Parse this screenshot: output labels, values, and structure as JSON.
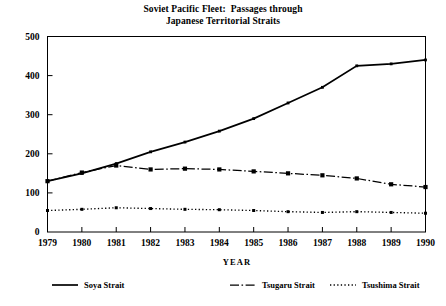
{
  "title": {
    "line1": "Soviet Pacific Fleet:  Passages through",
    "line2": "Japanese Territorial Straits"
  },
  "axes": {
    "xlabel": "YEAR",
    "ylabel": "",
    "ytick_labels": [
      "0",
      "100",
      "200",
      "300",
      "400",
      "500"
    ],
    "xtick_labels": [
      "1979",
      "1980",
      "1981",
      "1982",
      "1983",
      "1984",
      "1985",
      "1986",
      "1987",
      "1988",
      "1989",
      "1990"
    ]
  },
  "legend": {
    "position": "below-axes",
    "entries": [
      {
        "label": "Soya Strait",
        "style": "solid"
      },
      {
        "label": "Tsugaru Strait",
        "style": "dashdot"
      },
      {
        "label": "Tsushima Strait",
        "style": "dotted"
      }
    ]
  },
  "colors": {
    "ink": "#000000",
    "background": "#ffffff"
  },
  "chart_data": {
    "type": "line",
    "title": "Soviet Pacific Fleet:  Passages through Japanese Territorial Straits",
    "xlabel": "YEAR",
    "ylabel": "",
    "x": [
      1979,
      1980,
      1981,
      1982,
      1983,
      1984,
      1985,
      1986,
      1987,
      1988,
      1989,
      1990
    ],
    "categories": [
      "1979",
      "1980",
      "1981",
      "1982",
      "1983",
      "1984",
      "1985",
      "1986",
      "1987",
      "1988",
      "1989",
      "1990"
    ],
    "xlim": [
      1979,
      1990
    ],
    "ylim": [
      0,
      500
    ],
    "ytick_values": [
      0,
      100,
      200,
      300,
      400,
      500
    ],
    "grid": false,
    "legend_position": "bottom",
    "series": [
      {
        "name": "Soya Strait",
        "style": "solid",
        "values": [
          130,
          150,
          175,
          205,
          230,
          258,
          290,
          330,
          370,
          425,
          430,
          440
        ]
      },
      {
        "name": "Tsugaru Strait",
        "style": "dashdot",
        "values": [
          130,
          152,
          170,
          160,
          162,
          160,
          155,
          150,
          145,
          137,
          122,
          115
        ]
      },
      {
        "name": "Tsushima Strait",
        "style": "dotted",
        "values": [
          55,
          58,
          62,
          60,
          58,
          57,
          55,
          52,
          50,
          52,
          50,
          48
        ]
      }
    ]
  }
}
